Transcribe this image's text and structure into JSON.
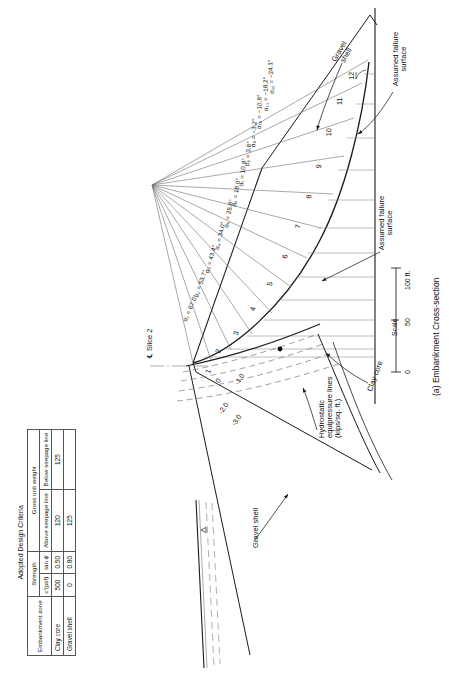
{
  "figure": {
    "caption": "(a) Embankment Cross-section",
    "annotations": {
      "slice_centerline": "℄ Slice 2",
      "gravel_shell_top": "Gravel shell",
      "gravel_shell_bottom": "Gravel shell",
      "clay_core": "Clay core",
      "assumed_failure_surface_top": "Assumed failure surface",
      "assumed_failure_surface_bottom": "Assumed failure surface",
      "hydrostatic_lines": "Hydrostatic equipressure lines (kips/sq. ft.)"
    },
    "scale": {
      "label": "Scale",
      "ticks": [
        "0",
        "50",
        "100 ft."
      ]
    },
    "slice_numbers": [
      "1",
      "2",
      "3",
      "4",
      "5",
      "6",
      "7",
      "8",
      "9",
      "10",
      "11",
      "12"
    ],
    "equipressure_labels": [
      "0",
      "-1.0",
      "-2.0",
      "-3.0"
    ],
    "alpha_labels": [
      "α₁ = 67.0°",
      "α₂ = 53.7°",
      "α₃ = 43.4°",
      "α₄ = 34.0°",
      "α₅ = 25.8°",
      "α₆ = 18.0°",
      "α₇ = 10.8°",
      "α₈ = 3.8°",
      "α₉ = −3.2°",
      "α₁₀ = −10.8°",
      "α₁₁ = −18.2°",
      "α₁₂ = −24.1°"
    ]
  },
  "criteria_table": {
    "title": "Adopted Design Criteria",
    "group_headers": {
      "strength": "Strength",
      "unit_weight": "Gross unit weight"
    },
    "headers": {
      "zone": "Embankment zone",
      "cohesion": "cʹ(psf)",
      "tanphi": "tan ϕʹ",
      "above": "Above seepage line",
      "below": "Below seepage line"
    },
    "rows": [
      {
        "zone": "Clay core",
        "cohesion": "500",
        "tanphi": "0.50",
        "above": "120",
        "below": "125"
      },
      {
        "zone": "Gravel shell",
        "cohesion": "0",
        "tanphi": "0.80",
        "above": "125",
        "below": ""
      }
    ]
  },
  "colors": {
    "ink": "#1a1a1a",
    "thin": "#6f6f6f",
    "dash": "#7a7a7a",
    "rule": "#555555"
  }
}
